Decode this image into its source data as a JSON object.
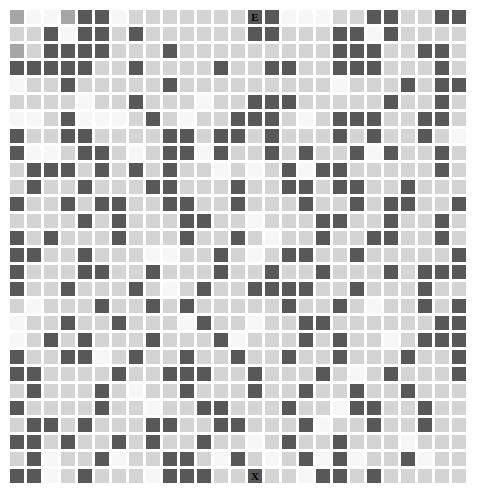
{
  "page": {
    "background_color": "#ffffff",
    "top_caption": ""
  },
  "grid": {
    "columns": 27,
    "rows": 28,
    "cell_size_px": 14,
    "cell_pitch_px": 17,
    "origin_x_px": 10,
    "origin_y_px": 10,
    "palette": {
      "shade_0_white": "#f7f7f7",
      "shade_1_light": "#d4d4d4",
      "shade_2_medium": "#a6a6a6",
      "shade_3_dark": "#585858"
    },
    "markers": {
      "entrance": {
        "label": "E",
        "row": 0,
        "col": 14
      },
      "exit": {
        "label": "X",
        "row": 27,
        "col": 14
      }
    },
    "cells": [
      [
        2,
        0,
        0,
        2,
        3,
        3,
        0,
        1,
        1,
        1,
        1,
        1,
        1,
        1,
        3,
        3,
        0,
        0,
        0,
        1,
        1,
        3,
        3,
        1,
        1,
        3,
        3
      ],
      [
        1,
        1,
        3,
        0,
        3,
        3,
        1,
        3,
        1,
        1,
        1,
        1,
        1,
        1,
        3,
        3,
        1,
        1,
        1,
        3,
        3,
        0,
        3,
        1,
        1,
        1,
        1
      ],
      [
        2,
        1,
        3,
        3,
        3,
        3,
        1,
        1,
        1,
        3,
        1,
        1,
        1,
        1,
        1,
        1,
        1,
        1,
        1,
        3,
        3,
        3,
        1,
        1,
        3,
        3,
        1
      ],
      [
        3,
        3,
        3,
        3,
        3,
        1,
        1,
        3,
        1,
        1,
        1,
        1,
        3,
        1,
        1,
        3,
        3,
        1,
        1,
        3,
        3,
        3,
        1,
        1,
        1,
        3,
        1
      ],
      [
        0,
        1,
        1,
        3,
        1,
        1,
        1,
        1,
        1,
        3,
        1,
        1,
        1,
        1,
        1,
        1,
        1,
        1,
        1,
        0,
        1,
        1,
        1,
        3,
        1,
        3,
        3
      ],
      [
        1,
        1,
        1,
        1,
        0,
        1,
        1,
        3,
        1,
        1,
        1,
        0,
        1,
        1,
        3,
        3,
        3,
        1,
        1,
        1,
        1,
        1,
        3,
        1,
        1,
        3,
        1
      ],
      [
        0,
        0,
        1,
        3,
        0,
        0,
        0,
        1,
        3,
        1,
        0,
        1,
        1,
        3,
        3,
        3,
        1,
        0,
        1,
        3,
        3,
        3,
        1,
        1,
        3,
        3,
        1
      ],
      [
        3,
        1,
        1,
        3,
        3,
        1,
        1,
        1,
        1,
        3,
        3,
        1,
        3,
        3,
        1,
        3,
        1,
        1,
        1,
        3,
        1,
        3,
        1,
        1,
        3,
        1,
        0
      ],
      [
        3,
        0,
        0,
        1,
        3,
        3,
        1,
        0,
        1,
        3,
        3,
        0,
        3,
        1,
        1,
        3,
        1,
        3,
        1,
        1,
        3,
        0,
        3,
        1,
        1,
        3,
        1
      ],
      [
        1,
        3,
        3,
        3,
        1,
        3,
        1,
        3,
        1,
        3,
        1,
        1,
        0,
        1,
        0,
        1,
        3,
        0,
        3,
        3,
        1,
        1,
        1,
        1,
        1,
        3,
        1
      ],
      [
        1,
        3,
        1,
        1,
        3,
        1,
        1,
        1,
        3,
        3,
        1,
        1,
        1,
        3,
        1,
        1,
        3,
        3,
        1,
        3,
        3,
        1,
        1,
        3,
        1,
        1,
        1
      ],
      [
        3,
        1,
        1,
        3,
        1,
        3,
        3,
        1,
        1,
        3,
        3,
        1,
        1,
        3,
        1,
        1,
        1,
        3,
        1,
        1,
        3,
        1,
        3,
        3,
        1,
        1,
        3
      ],
      [
        1,
        1,
        1,
        1,
        3,
        1,
        3,
        1,
        1,
        1,
        3,
        3,
        1,
        1,
        0,
        1,
        1,
        1,
        3,
        3,
        1,
        1,
        3,
        1,
        1,
        3,
        1
      ],
      [
        3,
        1,
        3,
        1,
        1,
        1,
        3,
        1,
        1,
        1,
        3,
        1,
        1,
        3,
        1,
        0,
        1,
        1,
        3,
        1,
        1,
        3,
        3,
        1,
        1,
        3,
        1
      ],
      [
        3,
        3,
        1,
        1,
        3,
        1,
        1,
        1,
        0,
        0,
        1,
        1,
        3,
        1,
        0,
        1,
        3,
        3,
        1,
        1,
        3,
        1,
        1,
        1,
        1,
        1,
        3
      ],
      [
        3,
        1,
        1,
        1,
        3,
        3,
        1,
        1,
        3,
        1,
        1,
        1,
        3,
        1,
        1,
        3,
        1,
        1,
        3,
        1,
        1,
        1,
        3,
        1,
        3,
        3,
        3
      ],
      [
        3,
        1,
        1,
        3,
        1,
        1,
        1,
        3,
        1,
        0,
        1,
        3,
        1,
        1,
        3,
        3,
        3,
        3,
        1,
        1,
        3,
        1,
        1,
        1,
        3,
        1,
        1
      ],
      [
        1,
        0,
        1,
        1,
        1,
        3,
        1,
        1,
        3,
        1,
        3,
        1,
        1,
        1,
        1,
        1,
        3,
        1,
        1,
        3,
        1,
        0,
        1,
        1,
        3,
        1,
        3
      ],
      [
        0,
        1,
        1,
        3,
        1,
        1,
        3,
        1,
        1,
        1,
        0,
        3,
        1,
        1,
        0,
        1,
        1,
        3,
        3,
        1,
        1,
        1,
        1,
        1,
        1,
        3,
        3
      ],
      [
        0,
        1,
        3,
        1,
        3,
        1,
        1,
        1,
        3,
        1,
        1,
        1,
        3,
        0,
        1,
        1,
        1,
        3,
        1,
        3,
        1,
        1,
        0,
        1,
        3,
        3,
        3
      ],
      [
        3,
        1,
        1,
        3,
        3,
        0,
        1,
        3,
        1,
        1,
        3,
        1,
        1,
        3,
        1,
        1,
        3,
        1,
        1,
        3,
        1,
        1,
        1,
        3,
        1,
        1,
        3
      ],
      [
        3,
        3,
        1,
        1,
        1,
        1,
        3,
        1,
        1,
        3,
        3,
        3,
        1,
        1,
        3,
        1,
        1,
        1,
        3,
        1,
        0,
        1,
        3,
        1,
        1,
        1,
        3
      ],
      [
        1,
        3,
        1,
        1,
        1,
        3,
        1,
        0,
        1,
        1,
        3,
        1,
        1,
        1,
        3,
        1,
        1,
        3,
        1,
        1,
        3,
        1,
        1,
        3,
        1,
        1,
        1
      ],
      [
        3,
        1,
        1,
        1,
        1,
        3,
        1,
        1,
        0,
        1,
        1,
        3,
        3,
        1,
        1,
        1,
        3,
        1,
        1,
        0,
        3,
        3,
        1,
        1,
        3,
        1,
        1
      ],
      [
        1,
        3,
        3,
        1,
        3,
        1,
        1,
        1,
        3,
        3,
        1,
        1,
        3,
        3,
        1,
        1,
        1,
        3,
        0,
        1,
        1,
        3,
        1,
        1,
        3,
        1,
        1
      ],
      [
        3,
        3,
        1,
        3,
        1,
        1,
        3,
        1,
        3,
        1,
        1,
        3,
        1,
        1,
        0,
        1,
        3,
        1,
        1,
        3,
        1,
        1,
        1,
        0,
        1,
        1,
        1
      ],
      [
        1,
        3,
        0,
        1,
        1,
        3,
        0,
        1,
        1,
        3,
        3,
        1,
        0,
        3,
        1,
        0,
        1,
        3,
        0,
        3,
        0,
        1,
        1,
        3,
        0,
        1,
        1
      ],
      [
        3,
        3,
        0,
        1,
        3,
        1,
        1,
        1,
        0,
        3,
        3,
        3,
        1,
        1,
        3,
        1,
        1,
        0,
        3,
        3,
        1,
        3,
        1,
        1,
        1,
        1,
        1
      ]
    ]
  }
}
